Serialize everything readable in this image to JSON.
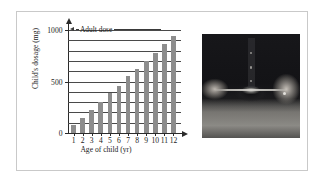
{
  "figure": {
    "caption": ""
  },
  "chart_data": {
    "type": "bar",
    "title": "",
    "xlabel": "Age of child (yr)",
    "ylabel": "Child's dosage (mg)",
    "categories": [
      "1",
      "2",
      "3",
      "4",
      "5",
      "6",
      "7",
      "8",
      "9",
      "10",
      "11",
      "12"
    ],
    "values": [
      77,
      143,
      200,
      250,
      294,
      333,
      368,
      400,
      429,
      455,
      478,
      500
    ],
    "bar_pixel_fraction": [
      0.075,
      0.145,
      0.22,
      0.3,
      0.385,
      0.46,
      0.55,
      0.62,
      0.7,
      0.78,
      0.86,
      0.945
    ],
    "ylim": [
      0,
      1000
    ],
    "ytick_values": [
      0,
      500,
      1000
    ],
    "ytick_labels": [
      "0",
      "500",
      "1000"
    ],
    "gridlines": [
      100,
      200,
      300,
      400,
      500,
      600,
      700,
      800,
      900,
      1000
    ],
    "grid": true,
    "legend": "none",
    "bar_color": "#8d8d8d",
    "axis_color": "#2b2b2b",
    "grid_color": "#4a4a4a",
    "annotations": [
      {
        "text": "Adult dose",
        "value": 1000,
        "arrow": "left"
      }
    ]
  },
  "photo": {
    "alt": "Adult hands holding a spoon of liquid medicine"
  }
}
